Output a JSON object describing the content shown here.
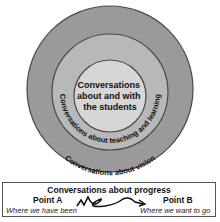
{
  "rings": {
    "inner_label_lines": [
      "Conversations",
      "about and with",
      "the students"
    ],
    "middle_label": "Conversations about teaching and learning",
    "outer_label": "Conversations about vision",
    "colors": {
      "outer": "#9a9a9a",
      "middle": "#b8b8b8",
      "inner": "#d6d6d6",
      "stroke": "#4a4a4a"
    }
  },
  "progress": {
    "title": "Conversations about progress",
    "point_a": {
      "label": "Point A",
      "caption": "Where we have been"
    },
    "point_b": {
      "label": "Point B",
      "caption": "Where we want to go"
    }
  }
}
